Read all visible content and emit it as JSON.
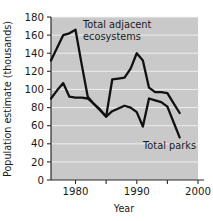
{
  "chart_data": {
    "type": "line",
    "title": "",
    "xlabel": "Year",
    "ylabel": "Population estimate (thousands)",
    "xlim": [
      1976,
      2000
    ],
    "ylim": [
      0,
      180
    ],
    "grid": true,
    "legend_position": "inline-annotations",
    "y_ticks": [
      0,
      20,
      40,
      60,
      80,
      100,
      120,
      140,
      160,
      180
    ],
    "y_tick_labels": [
      "0",
      "20",
      "40",
      "60",
      "80",
      "100",
      "120",
      "140",
      "160",
      "180"
    ],
    "x_ticks": [
      1980,
      1985,
      1990,
      1995,
      2000
    ],
    "x_tick_labels": [
      "1980",
      "",
      "1990",
      "",
      "2000"
    ],
    "x_labeled_ticks": [
      "1980",
      "1990",
      "2000"
    ],
    "series": [
      {
        "name": "Total adjacent ecosystems",
        "x": [
          1976,
          1977,
          1978,
          1979,
          1980,
          1981,
          1982,
          1983,
          1984,
          1985,
          1986,
          1987,
          1988,
          1989,
          1990,
          1991,
          1992,
          1993,
          1994,
          1995,
          1996,
          1997
        ],
        "values": [
          132,
          146,
          160,
          162,
          166,
          128,
          92,
          84,
          77,
          70,
          111,
          112,
          113,
          123,
          140,
          132,
          102,
          97,
          97,
          96,
          85,
          74
        ]
      },
      {
        "name": "Total parks",
        "x": [
          1976,
          1977,
          1978,
          1979,
          1980,
          1981,
          1982,
          1983,
          1984,
          1985,
          1986,
          1987,
          1988,
          1989,
          1990,
          1991,
          1992,
          1993,
          1994,
          1995,
          1996,
          1997
        ],
        "values": [
          90,
          99,
          107,
          92,
          91,
          91,
          90,
          84,
          78,
          70,
          76,
          79,
          82,
          80,
          75,
          59,
          90,
          88,
          86,
          81,
          64,
          47
        ]
      }
    ],
    "annotations": [
      {
        "text_line1": "Total adjacent",
        "text_line2": "ecosystems",
        "for_series": "Total adjacent ecosystems"
      },
      {
        "text": "Total parks",
        "for_series": "Total parks"
      }
    ],
    "colors": {
      "plot_background": "#c9c9c9",
      "gridline": "#f2f2f2",
      "line": "#111111",
      "axis": "#2b2b2b",
      "text": "#1a1a1a",
      "page_background": "#ffffff"
    }
  },
  "labels": {
    "y_axis_title": "Population estimate (thousands)",
    "x_axis_title": "Year",
    "series_one_line_one": "Total adjacent",
    "series_one_line_two": "ecosystems",
    "series_two": "Total parks",
    "y_180": "180",
    "y_160": "160",
    "y_140": "140",
    "y_120": "120",
    "y_100": "100",
    "y_80": "80",
    "y_60": "60",
    "y_40": "40",
    "y_20": "20",
    "y_0": "0",
    "x_1980": "1980",
    "x_1990": "1990",
    "x_2000": "2000"
  }
}
